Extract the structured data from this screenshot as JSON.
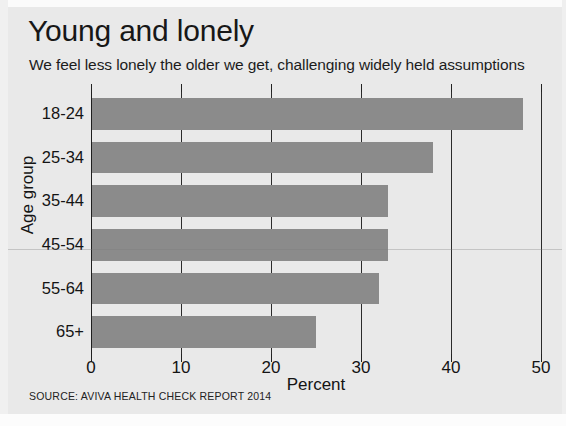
{
  "chart_data": {
    "type": "bar",
    "orientation": "horizontal",
    "title": "Young and lonely",
    "subtitle": "We feel less lonely the older we get, challenging widely held assumptions",
    "xlabel": "Percent",
    "ylabel": "Age group",
    "categories": [
      "18-24",
      "25-34",
      "35-44",
      "45-54",
      "55-64",
      "65+"
    ],
    "values": [
      48,
      38,
      33,
      33,
      32,
      25
    ],
    "xlim": [
      0,
      50
    ],
    "xticks": [
      0,
      10,
      20,
      30,
      40,
      50
    ],
    "xtick_labels": [
      "0",
      "10",
      "20",
      "30",
      "40",
      "50"
    ],
    "grid": "vertical",
    "legend": "none",
    "bar_color": "#8b8b8b",
    "background_color": "#e9e9e9",
    "axis_color": "#1f1f1f",
    "source": "SOURCE: AVIVA HEALTH CHECK REPORT 2014"
  }
}
